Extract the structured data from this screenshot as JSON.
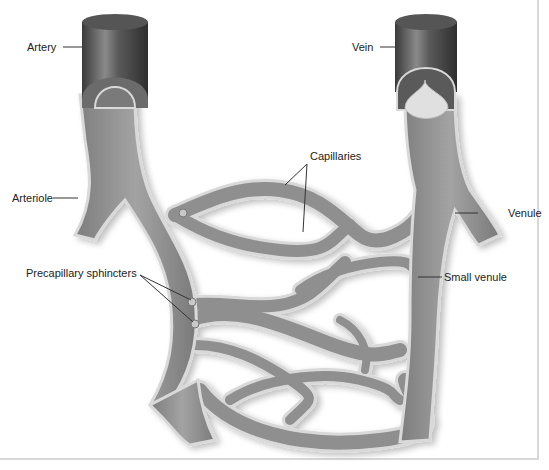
{
  "diagram": {
    "labels": {
      "artery": "Artery",
      "vein": "Vein",
      "arteriole": "Arteriole",
      "capillaries": "Capillaries",
      "venule": "Venule",
      "precapillary_sphincters": "Precapillary sphincters",
      "small_venule": "Small venule"
    },
    "colors": {
      "vessel_fill": "#8e8e8e",
      "vessel_edge": "#d9d9d9",
      "cylinder_dark": "#3e3e3e",
      "cylinder_light": "#8a8a8a",
      "leader_line": "#333333",
      "panel_border": "#d8d8d8"
    }
  }
}
